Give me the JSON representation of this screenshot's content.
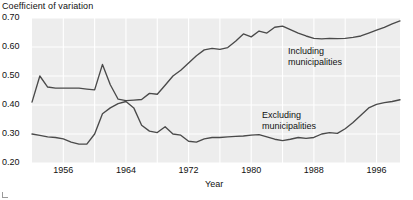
{
  "chart_data": {
    "type": "line",
    "title": "",
    "ylabel": "Coefficient of variation",
    "xlabel": "Year",
    "ylim": [
      0.2,
      0.7
    ],
    "xlim": [
      1952,
      1999
    ],
    "grid": true,
    "grid_color": "#ffffff",
    "plot_background": "#ededed",
    "line_color": "#4a4a4a",
    "legend_position": "inline-annotation",
    "ytick_labels": [
      "0.70",
      "0.60",
      "0.50",
      "0.40",
      "0.30",
      "0.20"
    ],
    "ytick_values": [
      0.7,
      0.6,
      0.5,
      0.4,
      0.3,
      0.2
    ],
    "xtick_labels": [
      "1956",
      "1964",
      "1972",
      "1980",
      "1988",
      "1996"
    ],
    "xtick_values": [
      1956,
      1964,
      1972,
      1980,
      1988,
      1996
    ],
    "annotations": [
      {
        "text_line1": "Including",
        "text_line2": "municipalities",
        "series": "Including municipalities"
      },
      {
        "text_line1": "Excluding",
        "text_line2": "municipalities",
        "series": "Excluding municipalities"
      }
    ],
    "x": [
      1952,
      1953,
      1954,
      1955,
      1956,
      1957,
      1958,
      1959,
      1960,
      1961,
      1962,
      1963,
      1964,
      1965,
      1966,
      1967,
      1968,
      1969,
      1970,
      1971,
      1972,
      1973,
      1974,
      1975,
      1976,
      1977,
      1978,
      1979,
      1980,
      1981,
      1982,
      1983,
      1984,
      1985,
      1986,
      1987,
      1988,
      1989,
      1990,
      1991,
      1992,
      1993,
      1994,
      1995,
      1996,
      1997,
      1998,
      1999
    ],
    "series": [
      {
        "name": "Including municipalities",
        "values": [
          0.41,
          0.5,
          0.462,
          0.458,
          0.458,
          0.458,
          0.458,
          0.455,
          0.452,
          0.54,
          0.47,
          0.42,
          0.415,
          0.417,
          0.419,
          0.44,
          0.437,
          0.468,
          0.5,
          0.52,
          0.545,
          0.57,
          0.59,
          0.595,
          0.592,
          0.598,
          0.62,
          0.645,
          0.635,
          0.655,
          0.648,
          0.668,
          0.672,
          0.66,
          0.648,
          0.638,
          0.63,
          0.628,
          0.63,
          0.629,
          0.63,
          0.633,
          0.638,
          0.648,
          0.658,
          0.668,
          0.68,
          0.69
        ]
      },
      {
        "name": "Excluding municipalities",
        "values": [
          0.3,
          0.295,
          0.29,
          0.288,
          0.283,
          0.272,
          0.265,
          0.265,
          0.3,
          0.37,
          0.39,
          0.405,
          0.412,
          0.39,
          0.33,
          0.31,
          0.305,
          0.325,
          0.3,
          0.296,
          0.275,
          0.272,
          0.283,
          0.288,
          0.288,
          0.29,
          0.292,
          0.293,
          0.296,
          0.298,
          0.29,
          0.282,
          0.277,
          0.282,
          0.288,
          0.285,
          0.288,
          0.3,
          0.305,
          0.302,
          0.318,
          0.34,
          0.365,
          0.39,
          0.402,
          0.408,
          0.412,
          0.418
        ]
      }
    ]
  },
  "layout": {
    "plot_left": 32,
    "plot_right": 400,
    "plot_top": 18,
    "plot_bottom": 163,
    "width": 413,
    "height": 200
  }
}
